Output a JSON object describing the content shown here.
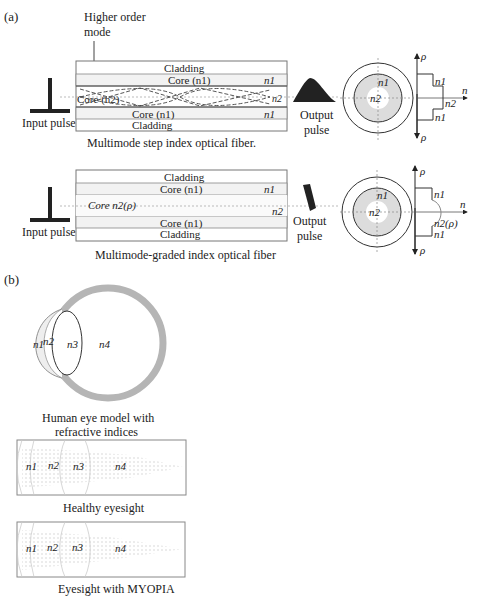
{
  "panel_a": {
    "label": "(a)",
    "annotation": {
      "line1": "Higher order",
      "line2": "mode"
    },
    "step_index": {
      "caption": "Multimode step index optical fiber.",
      "input_label": "Input pulse",
      "output_label_1": "Output",
      "output_label_2": "pulse",
      "layers": {
        "cladding_top": "Cladding",
        "core_top": "Core (n1)",
        "core_center": "Core (n2)",
        "core_bottom": "Core (n1)",
        "cladding_bottom": "Cladding"
      },
      "right_labels": {
        "n1_top": "n1",
        "n2": "n2",
        "n1_bottom": "n1"
      },
      "cross_section": {
        "outer": "n1",
        "inner": "n2"
      },
      "profile": {
        "axis_rho_top": "ρ",
        "axis_rho_bottom": "ρ",
        "axis_n": "n",
        "n1_top": "n1",
        "n2": "n2",
        "n1_bottom": "n1"
      }
    },
    "graded_index": {
      "caption": "Multimode-graded index optical fiber",
      "input_label": "Input pulse",
      "output_label_1": "Output",
      "output_label_2": "pulse",
      "layers": {
        "cladding_top": "Cladding",
        "core_top": "Core (n1)",
        "core_center": "Core n2(ρ)",
        "core_bottom": "Core (n1)",
        "cladding_bottom": "Cladding"
      },
      "right_labels": {
        "n1": "n1",
        "n2": "n2"
      },
      "cross_section": {
        "outer": "n1",
        "inner": "n2"
      },
      "profile": {
        "axis_rho_top": "ρ",
        "axis_rho_bottom": "ρ",
        "axis_n": "n",
        "n1_top": "n1",
        "n2": "n2(ρ)",
        "n1_bottom": "n1"
      }
    }
  },
  "panel_b": {
    "label": "(b)",
    "eye_model": {
      "caption_line1": "Human eye model with",
      "caption_line2": "refractive indices",
      "labels": [
        "n1",
        "n2",
        "n3",
        "n4"
      ]
    },
    "healthy": {
      "caption": "Healthy eyesight",
      "labels": [
        "n1",
        "n2",
        "n3",
        "n4"
      ]
    },
    "myopia": {
      "caption": "Eyesight with MYOPIA",
      "labels": [
        "n1",
        "n2",
        "n3",
        "n4"
      ]
    }
  }
}
